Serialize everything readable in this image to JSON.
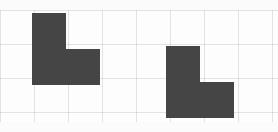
{
  "canvas": {
    "width": 278,
    "height": 132,
    "background_color": "#ffffff",
    "margin_color": "#fbfbfb",
    "margin_top_height": 10,
    "margin_bottom_height": 10
  },
  "grid": {
    "cell_size": 34,
    "line_color": "#afafb4",
    "line_width": 1,
    "visible": true,
    "origin_x": 0,
    "origin_y": 10
  },
  "shapes": [
    {
      "id": "shape-left",
      "label": "L-shaped block (upper left)",
      "kind": "l-tromino",
      "fill_color": "#454545",
      "x": 32,
      "y": 13,
      "width": 68,
      "height": 72,
      "cells": [
        [
          0,
          0
        ],
        [
          0,
          1
        ],
        [
          1,
          1
        ]
      ],
      "orientation": "foot-right-bottom"
    },
    {
      "id": "shape-right",
      "label": "L-shaped block (lower right)",
      "kind": "l-tromino",
      "fill_color": "#454545",
      "x": 166,
      "y": 46,
      "width": 68,
      "height": 72,
      "cells": [
        [
          0,
          0
        ],
        [
          0,
          1
        ],
        [
          1,
          1
        ]
      ],
      "orientation": "foot-right-bottom"
    }
  ]
}
